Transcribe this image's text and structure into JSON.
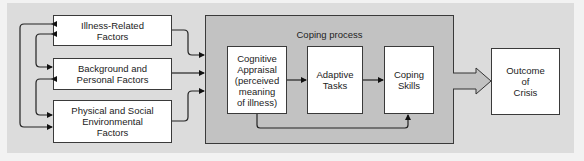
{
  "diagram": {
    "factors": [
      {
        "label": "Illness-Related\nFactors"
      },
      {
        "label": "Background and\nPersonal Factors"
      },
      {
        "label": "Physical and Social\nEnvironmental\nFactors"
      }
    ],
    "coping_process": {
      "title": "Coping process",
      "steps": [
        {
          "label": "Cognitive\nAppraisal\n(perceived\nmeaning\nof illness)"
        },
        {
          "label": "Adaptive\nTasks"
        },
        {
          "label": "Coping\nSkills"
        }
      ]
    },
    "outcome": {
      "label": "Outcome\nof\nCrisis"
    },
    "colors": {
      "background": "#dcdcdc",
      "coping_panel": "#c2c2c2",
      "box_fill": "#ffffff",
      "stroke": "#222222"
    }
  }
}
